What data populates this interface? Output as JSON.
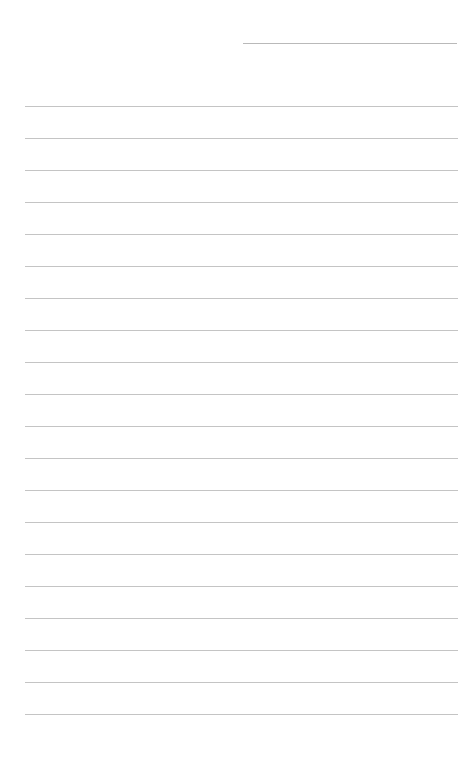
{
  "page": {
    "type": "lined-notepaper",
    "background": "#ffffff",
    "line_color": "#c4c4c4",
    "header_line": {
      "left": 243,
      "top": 43,
      "width": 214
    },
    "ruled_lines": {
      "count": 20,
      "left": 25,
      "width": 433,
      "first_top": 106,
      "spacing": 32
    }
  }
}
